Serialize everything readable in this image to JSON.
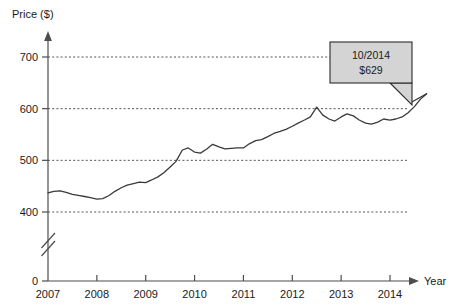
{
  "chart_data": {
    "type": "line",
    "title": "",
    "xlabel": "Year",
    "ylabel": "Price ($)",
    "ylim": [
      400,
      720
    ],
    "xlim": [
      2007.0,
      2014.83
    ],
    "grid": true,
    "axis_break": true,
    "y_ticks": [
      0,
      400,
      500,
      600,
      700
    ],
    "y_tick_labels": [
      "0",
      "400",
      "500",
      "600",
      "700"
    ],
    "x_ticks": [
      2007,
      2008,
      2009,
      2010,
      2011,
      2012,
      2013,
      2014
    ],
    "x_tick_labels": [
      "2007",
      "2008",
      "2009",
      "2010",
      "2011",
      "2012",
      "2013",
      "2014"
    ],
    "legend": [],
    "series": [
      {
        "name": "Price",
        "x": [
          2007.0,
          2007.12,
          2007.25,
          2007.37,
          2007.5,
          2007.62,
          2007.75,
          2007.87,
          2008.0,
          2008.12,
          2008.25,
          2008.37,
          2008.5,
          2008.62,
          2008.75,
          2008.87,
          2009.0,
          2009.12,
          2009.25,
          2009.37,
          2009.5,
          2009.62,
          2009.75,
          2009.87,
          2010.0,
          2010.12,
          2010.25,
          2010.37,
          2010.5,
          2010.62,
          2010.75,
          2010.87,
          2011.0,
          2011.12,
          2011.25,
          2011.37,
          2011.5,
          2011.62,
          2011.75,
          2011.87,
          2012.0,
          2012.12,
          2012.25,
          2012.37,
          2012.5,
          2012.62,
          2012.75,
          2012.87,
          2013.0,
          2013.12,
          2013.25,
          2013.37,
          2013.5,
          2013.62,
          2013.75,
          2013.87,
          2014.0,
          2014.12,
          2014.25,
          2014.37,
          2014.5,
          2014.62,
          2014.75
        ],
        "values": [
          437,
          440,
          441,
          438,
          434,
          432,
          430,
          428,
          425,
          426,
          432,
          440,
          447,
          452,
          455,
          458,
          457,
          462,
          468,
          476,
          487,
          498,
          520,
          524,
          516,
          514,
          522,
          531,
          526,
          522,
          523,
          524,
          524,
          532,
          538,
          540,
          546,
          552,
          556,
          560,
          566,
          572,
          578,
          584,
          603,
          588,
          580,
          576,
          584,
          590,
          586,
          578,
          572,
          570,
          574,
          580,
          578,
          580,
          584,
          592,
          604,
          618,
          629
        ]
      }
    ],
    "annotations": [
      {
        "name": "price-callout",
        "line1": "10/2014",
        "line2": "$629",
        "points_to_x": 2014.75,
        "points_to_y": 629,
        "fill_color": "#d4d4d4",
        "border_color": "#2b2b2b"
      }
    ],
    "colors": {
      "line": "#3a3a3a",
      "axis": "#4d4d4d",
      "grid": "#555555",
      "background": "#ffffff"
    }
  }
}
